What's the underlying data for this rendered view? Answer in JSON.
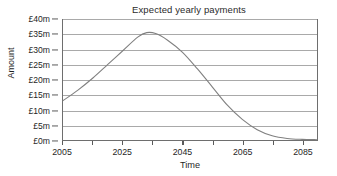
{
  "chart_data": {
    "type": "line",
    "title": "Expected yearly payments",
    "xlabel": "Time",
    "ylabel": "Amount",
    "xlim": [
      2005,
      2090
    ],
    "ylim": [
      0,
      40
    ],
    "grid": true,
    "legend": null,
    "y_ticks": [
      {
        "value": 40,
        "label": "£40m"
      },
      {
        "value": 35,
        "label": "£35m"
      },
      {
        "value": 30,
        "label": "£30m"
      },
      {
        "value": 25,
        "label": "£25m"
      },
      {
        "value": 20,
        "label": "£20m"
      },
      {
        "value": 15,
        "label": "£15m"
      },
      {
        "value": 10,
        "label": "£10m"
      },
      {
        "value": 5,
        "label": "£5m"
      },
      {
        "value": 0,
        "label": "£0m"
      }
    ],
    "x_ticks": [
      {
        "value": 2005,
        "label": "2005"
      },
      {
        "value": 2025,
        "label": "2025"
      },
      {
        "value": 2045,
        "label": "2045"
      },
      {
        "value": 2065,
        "label": "2065"
      },
      {
        "value": 2085,
        "label": "2085"
      }
    ],
    "x_minor_ticks": [
      2005,
      2015,
      2025,
      2035,
      2045,
      2055,
      2065,
      2075,
      2085
    ],
    "series": [
      {
        "name": "Expected yearly payments",
        "color": "#808080",
        "x": [
          2005,
          2010,
          2015,
          2020,
          2025,
          2030,
          2033,
          2036,
          2040,
          2045,
          2050,
          2055,
          2060,
          2065,
          2070,
          2075,
          2080,
          2085,
          2090
        ],
        "values": [
          13.0,
          16.5,
          20.5,
          25.0,
          29.5,
          34.0,
          35.5,
          35.2,
          33.0,
          29.0,
          23.5,
          17.5,
          11.5,
          6.8,
          3.4,
          1.4,
          0.5,
          0.2,
          0.1
        ]
      }
    ]
  }
}
